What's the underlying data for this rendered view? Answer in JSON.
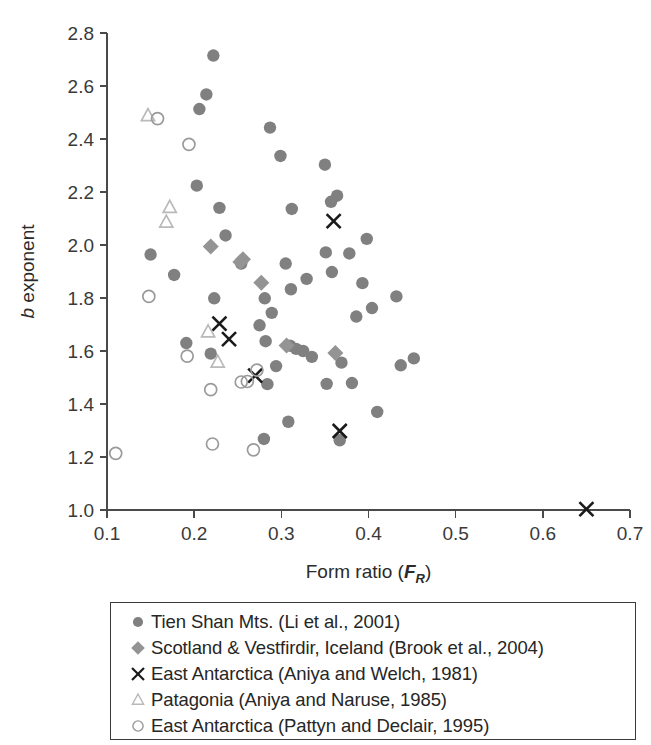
{
  "figure": {
    "background_color": "#ffffff"
  },
  "chart_data": {
    "type": "scatter",
    "title": "",
    "xlabel": "Form ratio (F_R)",
    "xlabel_main": "Form ratio (",
    "xlabel_italic": "F",
    "xlabel_sub": "R",
    "xlabel_close": ")",
    "ylabel": "b exponent",
    "ylabel_italic": "b",
    "ylabel_rest": " exponent",
    "xlim": [
      0.1,
      0.7
    ],
    "ylim": [
      1.0,
      2.8
    ],
    "xticks": [
      "0.1",
      "0.2",
      "0.3",
      "0.4",
      "0.5",
      "0.6",
      "0.7"
    ],
    "xtick_values": [
      0.1,
      0.2,
      0.3,
      0.4,
      0.5,
      0.6,
      0.7
    ],
    "yticks": [
      "1.0",
      "1.2",
      "1.4",
      "1.6",
      "1.8",
      "2.0",
      "2.2",
      "2.4",
      "2.6",
      "2.8"
    ],
    "ytick_values": [
      1.0,
      1.2,
      1.4,
      1.6,
      1.8,
      2.0,
      2.2,
      2.4,
      2.6,
      2.8
    ],
    "grid": false,
    "legend_position": "below-plot",
    "colors": {
      "circle_filled": "#808080",
      "diamond_filled": "#949494",
      "cross": "#1a1a1a",
      "triangle_open": "#b9b9b9",
      "circle_open": "#9a9a9a",
      "axis": "#4a4a4a",
      "text": "#262626"
    },
    "series": [
      {
        "name": "Tien Shan Mts. (Li et al., 2001)",
        "marker": "circle-filled",
        "color": "#808080",
        "points": [
          [
            0.222,
            2.715
          ],
          [
            0.214,
            2.568
          ],
          [
            0.206,
            2.513
          ],
          [
            0.287,
            2.443
          ],
          [
            0.299,
            2.336
          ],
          [
            0.35,
            2.303
          ],
          [
            0.203,
            2.224
          ],
          [
            0.364,
            2.186
          ],
          [
            0.357,
            2.163
          ],
          [
            0.229,
            2.14
          ],
          [
            0.312,
            2.136
          ],
          [
            0.236,
            2.036
          ],
          [
            0.398,
            2.023
          ],
          [
            0.351,
            1.972
          ],
          [
            0.378,
            1.968
          ],
          [
            0.15,
            1.964
          ],
          [
            0.254,
            1.93
          ],
          [
            0.305,
            1.93
          ],
          [
            0.358,
            1.898
          ],
          [
            0.177,
            1.887
          ],
          [
            0.329,
            1.872
          ],
          [
            0.393,
            1.856
          ],
          [
            0.311,
            1.833
          ],
          [
            0.432,
            1.806
          ],
          [
            0.223,
            1.799
          ],
          [
            0.281,
            1.799
          ],
          [
            0.404,
            1.762
          ],
          [
            0.289,
            1.744
          ],
          [
            0.386,
            1.73
          ],
          [
            0.275,
            1.697
          ],
          [
            0.191,
            1.63
          ],
          [
            0.282,
            1.637
          ],
          [
            0.31,
            1.62
          ],
          [
            0.317,
            1.608
          ],
          [
            0.325,
            1.6
          ],
          [
            0.219,
            1.59
          ],
          [
            0.335,
            1.578
          ],
          [
            0.452,
            1.572
          ],
          [
            0.369,
            1.556
          ],
          [
            0.437,
            1.546
          ],
          [
            0.294,
            1.543
          ],
          [
            0.284,
            1.475
          ],
          [
            0.352,
            1.476
          ],
          [
            0.381,
            1.479
          ],
          [
            0.41,
            1.37
          ],
          [
            0.308,
            1.333
          ],
          [
            0.28,
            1.268
          ],
          [
            0.367,
            1.263
          ]
        ]
      },
      {
        "name": "Scotland & Vestfirdir, Iceland (Brook et al., 2004)",
        "marker": "diamond-filled",
        "color": "#949494",
        "points": [
          [
            0.219,
            1.994
          ],
          [
            0.256,
            1.946
          ],
          [
            0.253,
            1.936
          ],
          [
            0.277,
            1.858
          ],
          [
            0.306,
            1.621
          ],
          [
            0.362,
            1.592
          ]
        ]
      },
      {
        "name": "East Antarctica (Aniya and Welch, 1981)",
        "marker": "cross",
        "color": "#1a1a1a",
        "points": [
          [
            0.36,
            2.09
          ],
          [
            0.229,
            1.703
          ],
          [
            0.24,
            1.645
          ],
          [
            0.27,
            1.507
          ],
          [
            0.367,
            1.298
          ],
          [
            0.65,
            1.003
          ]
        ]
      },
      {
        "name": "Patagonia (Aniya and Naruse, 1985)",
        "marker": "triangle-open",
        "color": "#b9b9b9",
        "points": [
          [
            0.147,
            2.488
          ],
          [
            0.172,
            2.142
          ],
          [
            0.168,
            2.086
          ],
          [
            0.216,
            1.672
          ],
          [
            0.227,
            1.558
          ]
        ]
      },
      {
        "name": "East Antarctica (Pattyn and Declair, 1995)",
        "marker": "circle-open",
        "color": "#9a9a9a",
        "points": [
          [
            0.158,
            2.477
          ],
          [
            0.194,
            2.38
          ],
          [
            0.148,
            1.806
          ],
          [
            0.192,
            1.581
          ],
          [
            0.219,
            1.454
          ],
          [
            0.254,
            1.483
          ],
          [
            0.261,
            1.485
          ],
          [
            0.272,
            1.528
          ],
          [
            0.221,
            1.249
          ],
          [
            0.268,
            1.227
          ],
          [
            0.11,
            1.214
          ]
        ]
      }
    ]
  },
  "legend": {
    "items": [
      {
        "marker": "circle-filled",
        "label": "Tien Shan Mts. (Li et al., 2001)"
      },
      {
        "marker": "diamond-filled",
        "label": "Scotland & Vestfirdir, Iceland (Brook et al., 2004)"
      },
      {
        "marker": "cross",
        "label": "East Antarctica (Aniya and Welch, 1981)"
      },
      {
        "marker": "triangle-open",
        "label": "Patagonia (Aniya and Naruse, 1985)"
      },
      {
        "marker": "circle-open",
        "label": "East Antarctica (Pattyn and Declair, 1995)"
      }
    ]
  }
}
